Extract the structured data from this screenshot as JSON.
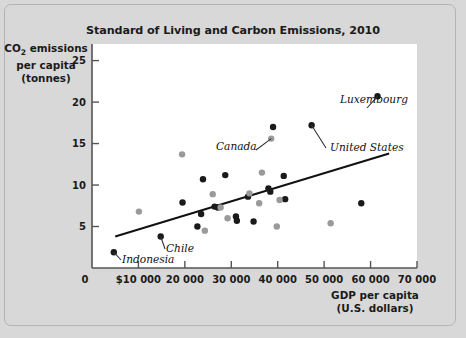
{
  "figure": {
    "background_color": "#d8d8d8",
    "plot_background_color": "#ffffff",
    "border_color": "#b4b4b4"
  },
  "title": "Standard of Living and Carbon Emissions, 2010",
  "axis": {
    "y_label_line1_prefix": "CO",
    "y_label_line1_sub": "2",
    "y_label_line1_suffix": " emissions",
    "y_label_line2": "per capita",
    "y_label_line3": "(tonnes)",
    "x_label_line1": "GDP per capita",
    "x_label_line2": "(U.S. dollars)",
    "origin_label": "0"
  },
  "chart_data": {
    "type": "scatter",
    "title": "Standard of Living and Carbon Emissions, 2010",
    "xlabel": "GDP per capita (U.S. dollars)",
    "ylabel": "CO2 emissions per capita (tonnes)",
    "xlim": [
      0,
      70000
    ],
    "ylim": [
      0,
      27
    ],
    "grid": false,
    "legend": "none",
    "xticks": [
      0,
      10000,
      20000,
      30000,
      40000,
      50000,
      60000,
      70000
    ],
    "xticklabels": [
      "0",
      "$10 000",
      "20 000",
      "30 000",
      "40 000",
      "50 000",
      "60 000",
      "70 000"
    ],
    "yticks": [
      5,
      10,
      15,
      20,
      25
    ],
    "yticklabels": [
      "5",
      "10",
      "15",
      "20",
      "25"
    ],
    "marker_colors": {
      "dark": "#1a1a1a",
      "light": "#9a9a9a"
    },
    "trendline": {
      "x": [
        5000,
        64000
      ],
      "y": [
        3.8,
        13.8
      ],
      "color": "#111111"
    },
    "series": [
      {
        "name": "dark-markers",
        "color": "#1a1a1a",
        "points": [
          {
            "x": 4700,
            "y": 1.9,
            "label": "Indonesia"
          },
          {
            "x": 19500,
            "y": 7.9
          },
          {
            "x": 22700,
            "y": 5.0
          },
          {
            "x": 23500,
            "y": 6.5
          },
          {
            "x": 26400,
            "y": 7.4
          },
          {
            "x": 27100,
            "y": 7.3
          },
          {
            "x": 28700,
            "y": 11.2
          },
          {
            "x": 23900,
            "y": 10.7
          },
          {
            "x": 31000,
            "y": 6.2
          },
          {
            "x": 31200,
            "y": 5.7
          },
          {
            "x": 33600,
            "y": 8.6
          },
          {
            "x": 34800,
            "y": 5.6
          },
          {
            "x": 38000,
            "y": 9.6
          },
          {
            "x": 38400,
            "y": 9.2
          },
          {
            "x": 39000,
            "y": 17.0
          },
          {
            "x": 41300,
            "y": 11.1
          },
          {
            "x": 41600,
            "y": 8.3
          },
          {
            "x": 47300,
            "y": 17.2,
            "label": "United States"
          },
          {
            "x": 58000,
            "y": 7.8
          },
          {
            "x": 61500,
            "y": 20.7,
            "label": "Luxembourg"
          },
          {
            "x": 14800,
            "y": 3.8,
            "label": "Chile"
          }
        ]
      },
      {
        "name": "light-markers",
        "color": "#9a9a9a",
        "points": [
          {
            "x": 10100,
            "y": 6.8
          },
          {
            "x": 19400,
            "y": 13.7
          },
          {
            "x": 24300,
            "y": 4.5
          },
          {
            "x": 26000,
            "y": 8.9
          },
          {
            "x": 27700,
            "y": 7.3
          },
          {
            "x": 29200,
            "y": 6.0
          },
          {
            "x": 33900,
            "y": 9.0
          },
          {
            "x": 36000,
            "y": 7.8
          },
          {
            "x": 36600,
            "y": 11.5
          },
          {
            "x": 38600,
            "y": 15.6,
            "label": "Canada"
          },
          {
            "x": 39800,
            "y": 5.0
          },
          {
            "x": 40400,
            "y": 8.2
          },
          {
            "x": 51400,
            "y": 5.4
          }
        ]
      }
    ],
    "annotations": [
      {
        "text": "Luxembourg",
        "target_x": 61500,
        "target_y": 20.7
      },
      {
        "text": "United States",
        "target_x": 47300,
        "target_y": 17.2
      },
      {
        "text": "Canada",
        "target_x": 38600,
        "target_y": 15.6
      },
      {
        "text": "Chile",
        "target_x": 14800,
        "target_y": 3.8
      },
      {
        "text": "Indonesia",
        "target_x": 4700,
        "target_y": 1.9
      }
    ]
  }
}
